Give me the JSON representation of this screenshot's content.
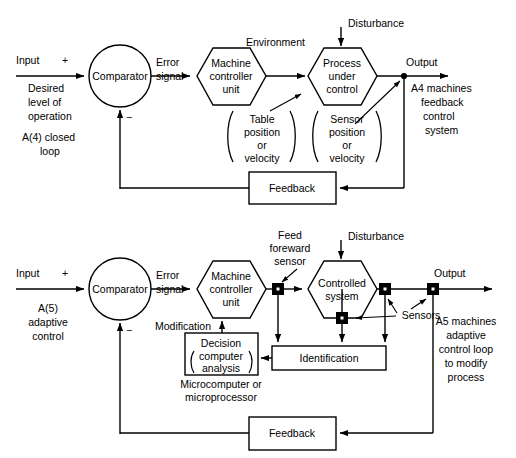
{
  "figure": {
    "type": "block-diagram",
    "background_color": "#ffffff",
    "line_color": "#000000"
  },
  "diagram_a4": {
    "id": "A(4)",
    "caption_left": [
      "Input",
      "Desired",
      "level of",
      "operation",
      "A(4) closed",
      "loop"
    ],
    "caption_right": [
      "Output",
      "A4 machines",
      "feedback",
      "control",
      "system"
    ],
    "input_label": "Input",
    "plus_sign": "+",
    "minus_sign": "−",
    "comparator_label": "Comparator",
    "error_label_line1": "Error",
    "error_label_line2": "signal",
    "machine_block": [
      "Machine",
      "controller",
      "unit"
    ],
    "environment_label": "Environment",
    "disturbance_label": "Disturbance",
    "process_block": [
      "Process",
      "under",
      "control"
    ],
    "table_note": [
      "Table",
      "position",
      "or",
      "velocity"
    ],
    "sensor_note": [
      "Sensor",
      "position",
      "or",
      "velocity"
    ],
    "output_label": "Output",
    "feedback_label": "Feedback",
    "side_note_left": [
      "Desired",
      "level of",
      "operation"
    ],
    "side_note_id": [
      "A(4) closed",
      "loop"
    ],
    "side_note_right": [
      "A4 machines",
      "feedback",
      "control",
      "system"
    ]
  },
  "diagram_a5": {
    "id": "A(5)",
    "input_label": "Input",
    "plus_sign": "+",
    "minus_sign": "−",
    "comparator_label": "Comparator",
    "error_label_line1": "Error",
    "error_label_line2": "signal",
    "machine_block": [
      "Machine",
      "controller",
      "unit"
    ],
    "feed_forward_note": [
      "Feed",
      "foreward",
      "sensor"
    ],
    "disturbance_label": "Disturbance",
    "controlled_block": [
      "Controlled",
      "system"
    ],
    "sensors_label": "Sensors",
    "modification_label": "Modification",
    "decision_block": [
      "Decision",
      "computer",
      "analysis"
    ],
    "micro_note": [
      "Microcomputer or",
      "microprocessor"
    ],
    "identification_label": "Identification",
    "output_label": "Output",
    "feedback_label": "Feedback",
    "side_note_id": [
      "A(5)",
      "adaptive",
      "control"
    ],
    "side_note_right": [
      "A5 machines",
      "adaptive",
      "control loop",
      "to modify",
      "process"
    ]
  }
}
